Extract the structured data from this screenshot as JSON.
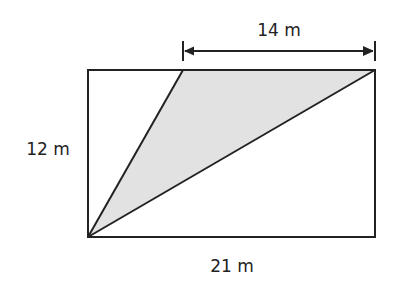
{
  "diagram": {
    "type": "geometry",
    "shapes": {
      "rectangle": {
        "width_label": "21 m",
        "height_label": "12 m"
      },
      "shaded_triangle": {
        "top_edge_label": "14 m",
        "fill": "#e2e2e2"
      }
    },
    "labels": {
      "top_dimension": "14 m",
      "left_dimension": "12 m",
      "bottom_dimension": "21 m"
    },
    "colors": {
      "stroke": "#222222",
      "shade": "#e2e2e2",
      "background": "#ffffff"
    }
  }
}
